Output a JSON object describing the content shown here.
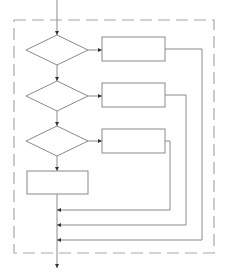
{
  "diagram": {
    "type": "flowchart",
    "title": "",
    "colors": {
      "line": "#8a8a8a",
      "boundary": "#a8a8a8",
      "arrowhead": "#333333",
      "background": "#ffffff"
    },
    "boundary": {
      "style": "dashed",
      "x": 14,
      "y": 20,
      "width": 200,
      "height": 233
    },
    "decisions": [
      {
        "id": "decision-1",
        "label": "",
        "cx": 57,
        "cy": 50,
        "w": 62,
        "h": 30
      },
      {
        "id": "decision-2",
        "label": "",
        "cx": 57,
        "cy": 96,
        "w": 62,
        "h": 30
      },
      {
        "id": "decision-3",
        "label": "",
        "cx": 57,
        "cy": 141,
        "w": 62,
        "h": 30
      }
    ],
    "processes": [
      {
        "id": "process-1",
        "label": "",
        "x": 102,
        "y": 37,
        "w": 63,
        "h": 24
      },
      {
        "id": "process-2",
        "label": "",
        "x": 102,
        "y": 83,
        "w": 63,
        "h": 24
      },
      {
        "id": "process-3",
        "label": "",
        "x": 102,
        "y": 129,
        "w": 63,
        "h": 24
      },
      {
        "id": "process-default",
        "label": "",
        "x": 27,
        "y": 171,
        "w": 61,
        "h": 23
      }
    ],
    "return_paths": [
      {
        "from": "process-1",
        "exit_y": 49,
        "x": 202,
        "join_y": 240
      },
      {
        "from": "process-2",
        "exit_y": 95,
        "x": 186,
        "join_y": 225
      },
      {
        "from": "process-3",
        "exit_y": 141,
        "x": 170,
        "join_y": 210
      }
    ],
    "main_flow": {
      "x": 57,
      "y_start": 0,
      "y_end": 268
    }
  }
}
